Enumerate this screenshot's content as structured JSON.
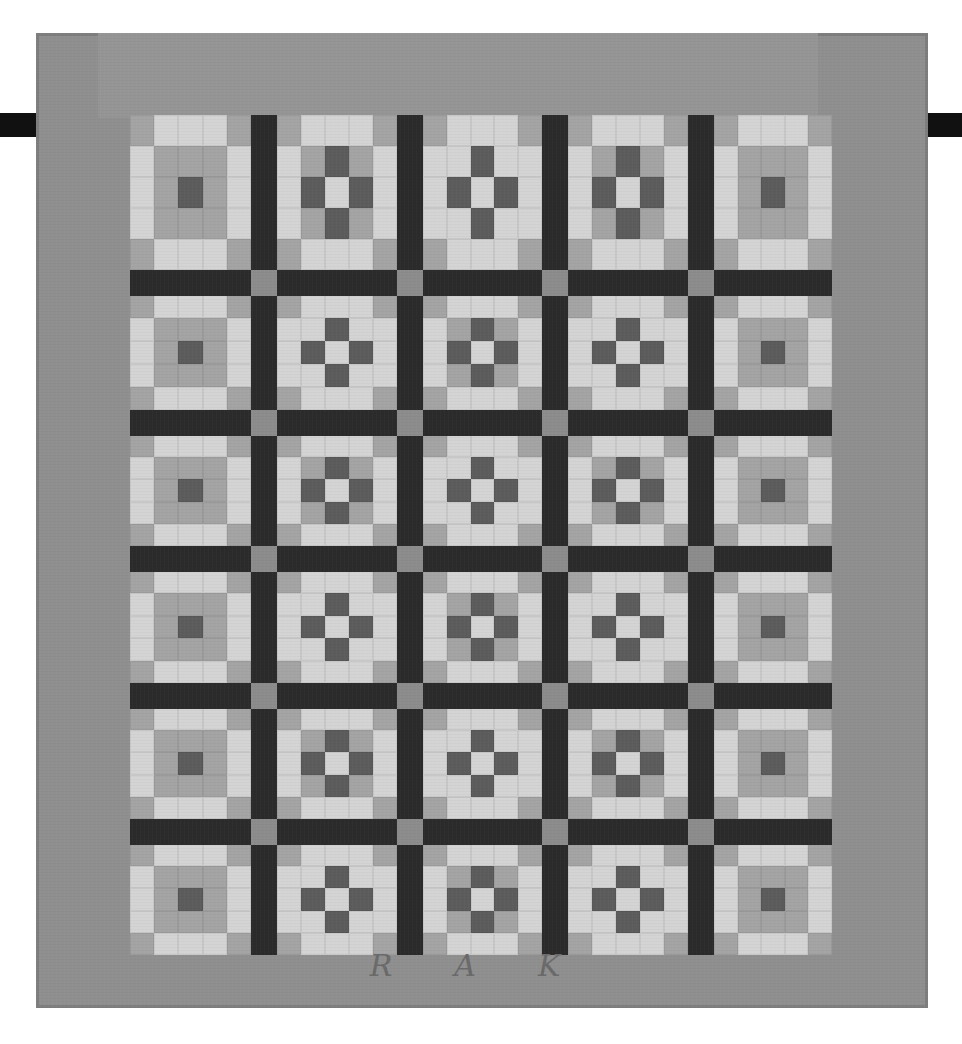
{
  "image": {
    "subject": "Pieced nine-patch quilt with dark sashing, hanging on a rod",
    "palette": {
      "background": "#ffffff",
      "border": "#8f8f8f",
      "sashing": "#2b2b2b",
      "cornerstone": "#8c8c8c",
      "rod": "#111111",
      "light": "#d4d4d4",
      "mid": "#a4a4a4",
      "dark": "#5c5c5c"
    },
    "layout": {
      "columns": 5,
      "rows": 6,
      "block_pattern": "5x5 grid: nine-patch center framed by light/mid border squares"
    },
    "initials": [
      "R",
      "A",
      "K"
    ]
  }
}
